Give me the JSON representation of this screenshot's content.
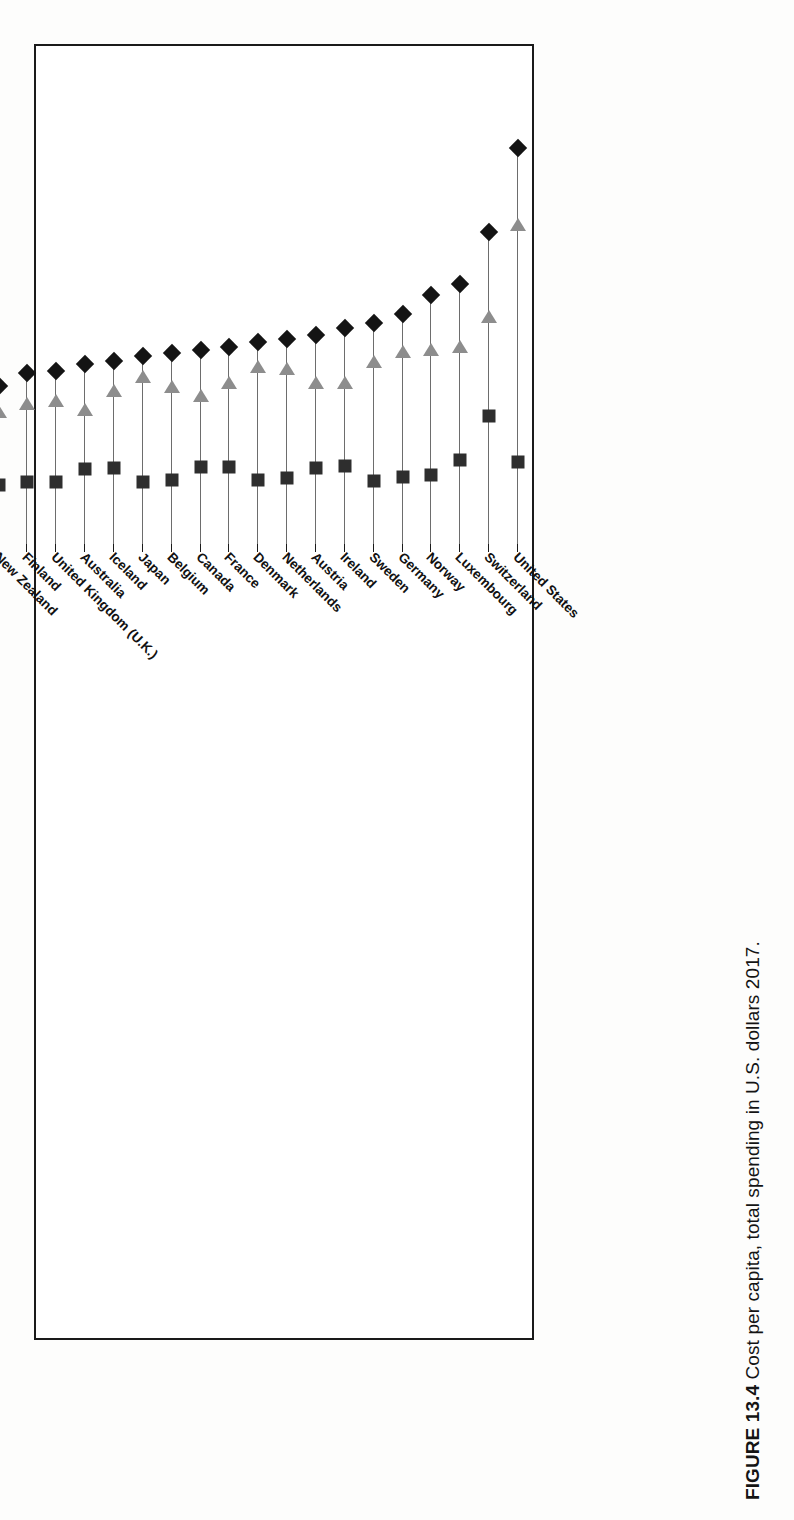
{
  "caption": {
    "figure_number": "FIGURE 13.4",
    "text": "Cost per capita, total spending in U.S. dollars 2017."
  },
  "axis": {
    "ticks": [
      "12k",
      "10k",
      "8k",
      "6k",
      "4k",
      "2k",
      "0k"
    ],
    "tick_values": [
      12000,
      10000,
      8000,
      6000,
      4000,
      2000,
      0
    ]
  },
  "chart_data": {
    "type": "scatter",
    "title": "Cost per capita, total spending in U.S. dollars 2017.",
    "xlabel": "",
    "ylabel": "",
    "xlim": [
      0,
      12000
    ],
    "grid": false,
    "legend_position": "none",
    "orientation": "horizontal-rows-rotated-90",
    "tick_labels": [
      "12k",
      "10k",
      "8k",
      "6k",
      "4k",
      "2k",
      "0k"
    ],
    "marker_series": [
      {
        "name": "total",
        "marker": "diamond",
        "color": "#141414"
      },
      {
        "name": "government-compulsory",
        "marker": "triangle-left",
        "color": "#8d8d8d"
      },
      {
        "name": "out-of-pocket-voluntary",
        "marker": "square",
        "color": "#2e2e2e"
      }
    ],
    "categories": [
      "United States",
      "Switzerland",
      "Luxembourg",
      "Norway",
      "Germany",
      "Sweden",
      "Ireland",
      "Austria",
      "Netherlands",
      "Denmark",
      "France",
      "Canada",
      "Belgium",
      "Japan",
      "Iceland",
      "Australia",
      "United Kingdom (U.K.)",
      "Finland",
      "New Zealand",
      "Italy",
      "Spain",
      "Korea",
      "Portugal",
      "Israel",
      "Slovenia",
      "Czech Republic",
      "Greece",
      "Slovak Republic",
      "Estonia",
      "Hungary",
      "Lithuania",
      "Poland",
      "Chile",
      "Latvia",
      "Brazil",
      "Russia",
      "Costa Rica",
      "Turkey",
      "South Africa",
      "Mexico",
      "Colombia",
      "Indonesia (Republic of)",
      "India",
      "China (People's Republic of)"
    ],
    "series": [
      {
        "name": "total",
        "marker": "diamond",
        "values": [
          10190,
          7920,
          6480,
          6190,
          5680,
          5420,
          5290,
          5100,
          4980,
          4900,
          4780,
          4700,
          4620,
          4540,
          4400,
          4320,
          4120,
          4060,
          3720,
          3420,
          3290,
          2960,
          2810,
          2760,
          2680,
          2580,
          2410,
          2290,
          2200,
          2100,
          2020,
          1940,
          1860,
          1750,
          1520,
          1380,
          1290,
          1200,
          1120,
          1050,
          980,
          720,
          620,
          560
        ]
      },
      {
        "name": "government-compulsory",
        "marker": "triangle-left",
        "values": [
          7940,
          5440,
          4620,
          4530,
          4470,
          4200,
          3640,
          3620,
          4010,
          4060,
          3630,
          3280,
          3520,
          3790,
          3420,
          2900,
          3150,
          3060,
          2840,
          2600,
          2340,
          1740,
          1720,
          1630,
          1820,
          2010,
          1460,
          1620,
          1510,
          1450,
          1350,
          1330,
          940,
          900,
          680,
          820,
          660,
          930,
          530,
          520,
          720,
          410,
          200,
          330
        ]
      },
      {
        "name": "out-of-pocket-voluntary",
        "marker": "square",
        "values": [
          1630,
          2880,
          1700,
          1280,
          1220,
          1110,
          1530,
          1470,
          1190,
          1140,
          1500,
          1490,
          1150,
          1080,
          1470,
          1450,
          1080,
          1090,
          1020,
          950,
          1010,
          1220,
          1100,
          1150,
          880,
          620,
          930,
          680,
          700,
          660,
          680,
          630,
          930,
          860,
          850,
          560,
          640,
          280,
          600,
          540,
          270,
          310,
          420,
          230
        ]
      }
    ]
  }
}
